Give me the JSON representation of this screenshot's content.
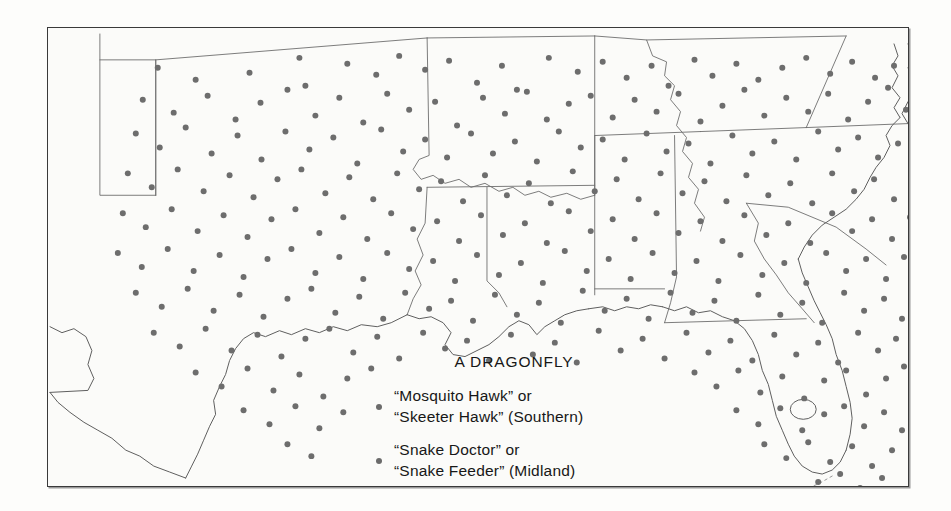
{
  "figure": {
    "type": "dot-distribution-map",
    "region": "Southern and Midland United States",
    "background_color": "#fbfbf9",
    "frame_color": "#3a3a3a",
    "dot_color": "#6d6d6d",
    "boundary_color": "#6e6e6e",
    "coast_color": "#5e5e5e"
  },
  "legend": {
    "title": "A DRAGONFLY",
    "entries": [
      {
        "marker": "filled-dot",
        "line1": "“Mosquito Hawk” or",
        "line2": "“Skeeter Hawk” (Southern)",
        "dialect": "Southern"
      },
      {
        "marker": "filled-dot",
        "line1": "“Snake Doctor” or",
        "line2": "“Snake Feeder” (Midland)",
        "dialect": "Midland"
      }
    ]
  },
  "map_data": {
    "dot_radius": 3.0,
    "dots": [
      [
        110,
        40
      ],
      [
        148,
        52
      ],
      [
        202,
        45
      ],
      [
        252,
        30
      ],
      [
        258,
        58
      ],
      [
        300,
        36
      ],
      [
        329,
        47
      ],
      [
        352,
        28
      ],
      [
        378,
        42
      ],
      [
        402,
        33
      ],
      [
        430,
        55
      ],
      [
        455,
        38
      ],
      [
        470,
        62
      ],
      [
        502,
        30
      ],
      [
        531,
        44
      ],
      [
        556,
        34
      ],
      [
        580,
        50
      ],
      [
        605,
        38
      ],
      [
        622,
        58
      ],
      [
        648,
        32
      ],
      [
        666,
        48
      ],
      [
        690,
        36
      ],
      [
        712,
        52
      ],
      [
        736,
        40
      ],
      [
        760,
        30
      ],
      [
        784,
        46
      ],
      [
        806,
        34
      ],
      [
        829,
        50
      ],
      [
        848,
        38
      ],
      [
        866,
        56
      ],
      [
        95,
        72
      ],
      [
        126,
        85
      ],
      [
        160,
        68
      ],
      [
        188,
        92
      ],
      [
        213,
        75
      ],
      [
        240,
        62
      ],
      [
        268,
        88
      ],
      [
        292,
        70
      ],
      [
        316,
        95
      ],
      [
        340,
        66
      ],
      [
        362,
        82
      ],
      [
        388,
        74
      ],
      [
        410,
        98
      ],
      [
        436,
        70
      ],
      [
        458,
        86
      ],
      [
        480,
        64
      ],
      [
        500,
        92
      ],
      [
        522,
        76
      ],
      [
        544,
        68
      ],
      [
        566,
        90
      ],
      [
        588,
        72
      ],
      [
        610,
        84
      ],
      [
        632,
        66
      ],
      [
        654,
        94
      ],
      [
        676,
        78
      ],
      [
        698,
        62
      ],
      [
        718,
        88
      ],
      [
        740,
        70
      ],
      [
        762,
        84
      ],
      [
        782,
        66
      ],
      [
        802,
        92
      ],
      [
        822,
        74
      ],
      [
        842,
        60
      ],
      [
        860,
        82
      ],
      [
        876,
        70
      ],
      [
        88,
        106
      ],
      [
        112,
        120
      ],
      [
        138,
        100
      ],
      [
        164,
        126
      ],
      [
        190,
        108
      ],
      [
        214,
        132
      ],
      [
        238,
        104
      ],
      [
        262,
        122
      ],
      [
        286,
        110
      ],
      [
        310,
        136
      ],
      [
        334,
        102
      ],
      [
        356,
        124
      ],
      [
        378,
        112
      ],
      [
        400,
        130
      ],
      [
        424,
        106
      ],
      [
        446,
        126
      ],
      [
        468,
        114
      ],
      [
        490,
        134
      ],
      [
        512,
        104
      ],
      [
        534,
        120
      ],
      [
        556,
        112
      ],
      [
        578,
        132
      ],
      [
        600,
        106
      ],
      [
        620,
        124
      ],
      [
        642,
        116
      ],
      [
        664,
        136
      ],
      [
        686,
        108
      ],
      [
        706,
        126
      ],
      [
        728,
        114
      ],
      [
        750,
        132
      ],
      [
        772,
        104
      ],
      [
        792,
        122
      ],
      [
        812,
        110
      ],
      [
        832,
        130
      ],
      [
        852,
        116
      ],
      [
        870,
        100
      ],
      [
        80,
        146
      ],
      [
        104,
        160
      ],
      [
        130,
        142
      ],
      [
        156,
        164
      ],
      [
        182,
        148
      ],
      [
        206,
        170
      ],
      [
        230,
        152
      ],
      [
        254,
        142
      ],
      [
        278,
        166
      ],
      [
        302,
        150
      ],
      [
        326,
        172
      ],
      [
        350,
        146
      ],
      [
        372,
        162
      ],
      [
        394,
        154
      ],
      [
        416,
        174
      ],
      [
        438,
        148
      ],
      [
        460,
        168
      ],
      [
        482,
        156
      ],
      [
        504,
        176
      ],
      [
        526,
        144
      ],
      [
        548,
        164
      ],
      [
        570,
        152
      ],
      [
        592,
        172
      ],
      [
        614,
        146
      ],
      [
        636,
        166
      ],
      [
        658,
        154
      ],
      [
        680,
        174
      ],
      [
        700,
        148
      ],
      [
        722,
        168
      ],
      [
        744,
        156
      ],
      [
        766,
        176
      ],
      [
        786,
        146
      ],
      [
        808,
        164
      ],
      [
        828,
        152
      ],
      [
        848,
        172
      ],
      [
        868,
        150
      ],
      [
        75,
        186
      ],
      [
        98,
        200
      ],
      [
        124,
        182
      ],
      [
        150,
        204
      ],
      [
        176,
        188
      ],
      [
        200,
        210
      ],
      [
        224,
        192
      ],
      [
        248,
        182
      ],
      [
        272,
        206
      ],
      [
        296,
        190
      ],
      [
        320,
        212
      ],
      [
        344,
        186
      ],
      [
        366,
        202
      ],
      [
        390,
        194
      ],
      [
        412,
        214
      ],
      [
        434,
        188
      ],
      [
        456,
        208
      ],
      [
        478,
        196
      ],
      [
        500,
        216
      ],
      [
        522,
        184
      ],
      [
        544,
        204
      ],
      [
        566,
        192
      ],
      [
        588,
        212
      ],
      [
        610,
        186
      ],
      [
        632,
        206
      ],
      [
        654,
        194
      ],
      [
        676,
        214
      ],
      [
        698,
        188
      ],
      [
        720,
        208
      ],
      [
        742,
        196
      ],
      [
        764,
        216
      ],
      [
        786,
        186
      ],
      [
        806,
        204
      ],
      [
        826,
        192
      ],
      [
        846,
        212
      ],
      [
        864,
        190
      ],
      [
        70,
        226
      ],
      [
        94,
        240
      ],
      [
        120,
        222
      ],
      [
        146,
        244
      ],
      [
        172,
        228
      ],
      [
        196,
        250
      ],
      [
        220,
        232
      ],
      [
        244,
        222
      ],
      [
        268,
        246
      ],
      [
        292,
        230
      ],
      [
        316,
        252
      ],
      [
        340,
        226
      ],
      [
        362,
        242
      ],
      [
        386,
        234
      ],
      [
        408,
        254
      ],
      [
        430,
        228
      ],
      [
        452,
        248
      ],
      [
        474,
        236
      ],
      [
        496,
        256
      ],
      [
        518,
        224
      ],
      [
        540,
        244
      ],
      [
        562,
        232
      ],
      [
        584,
        252
      ],
      [
        606,
        226
      ],
      [
        628,
        246
      ],
      [
        650,
        234
      ],
      [
        672,
        254
      ],
      [
        694,
        228
      ],
      [
        716,
        248
      ],
      [
        738,
        236
      ],
      [
        760,
        256
      ],
      [
        780,
        226
      ],
      [
        800,
        244
      ],
      [
        820,
        232
      ],
      [
        840,
        252
      ],
      [
        858,
        230
      ],
      [
        88,
        266
      ],
      [
        114,
        280
      ],
      [
        140,
        262
      ],
      [
        166,
        284
      ],
      [
        192,
        268
      ],
      [
        216,
        290
      ],
      [
        240,
        272
      ],
      [
        264,
        262
      ],
      [
        288,
        286
      ],
      [
        312,
        270
      ],
      [
        336,
        292
      ],
      [
        358,
        266
      ],
      [
        382,
        282
      ],
      [
        404,
        274
      ],
      [
        426,
        294
      ],
      [
        448,
        268
      ],
      [
        470,
        288
      ],
      [
        492,
        276
      ],
      [
        514,
        296
      ],
      [
        536,
        264
      ],
      [
        558,
        284
      ],
      [
        580,
        272
      ],
      [
        602,
        292
      ],
      [
        624,
        266
      ],
      [
        646,
        286
      ],
      [
        668,
        274
      ],
      [
        690,
        294
      ],
      [
        712,
        268
      ],
      [
        734,
        288
      ],
      [
        756,
        276
      ],
      [
        776,
        296
      ],
      [
        798,
        266
      ],
      [
        818,
        284
      ],
      [
        838,
        272
      ],
      [
        856,
        292
      ],
      [
        106,
        306
      ],
      [
        132,
        320
      ],
      [
        158,
        302
      ],
      [
        184,
        324
      ],
      [
        210,
        308
      ],
      [
        234,
        330
      ],
      [
        258,
        312
      ],
      [
        282,
        302
      ],
      [
        306,
        326
      ],
      [
        330,
        310
      ],
      [
        352,
        332
      ],
      [
        376,
        306
      ],
      [
        398,
        322
      ],
      [
        420,
        314
      ],
      [
        442,
        334
      ],
      [
        464,
        308
      ],
      [
        486,
        328
      ],
      [
        508,
        316
      ],
      [
        530,
        336
      ],
      [
        552,
        304
      ],
      [
        574,
        324
      ],
      [
        596,
        312
      ],
      [
        618,
        332
      ],
      [
        640,
        306
      ],
      [
        662,
        326
      ],
      [
        684,
        314
      ],
      [
        706,
        334
      ],
      [
        728,
        308
      ],
      [
        750,
        328
      ],
      [
        772,
        316
      ],
      [
        792,
        336
      ],
      [
        812,
        306
      ],
      [
        832,
        324
      ],
      [
        850,
        312
      ],
      [
        148,
        346
      ],
      [
        174,
        360
      ],
      [
        200,
        342
      ],
      [
        226,
        364
      ],
      [
        252,
        348
      ],
      [
        276,
        370
      ],
      [
        300,
        352
      ],
      [
        324,
        342
      ],
      [
        648,
        346
      ],
      [
        670,
        360
      ],
      [
        692,
        344
      ],
      [
        714,
        366
      ],
      [
        736,
        350
      ],
      [
        758,
        372
      ],
      [
        778,
        354
      ],
      [
        800,
        344
      ],
      [
        820,
        368
      ],
      [
        840,
        352
      ],
      [
        858,
        340
      ],
      [
        196,
        384
      ],
      [
        222,
        398
      ],
      [
        248,
        380
      ],
      [
        272,
        402
      ],
      [
        296,
        386
      ],
      [
        690,
        384
      ],
      [
        712,
        398
      ],
      [
        734,
        382
      ],
      [
        756,
        404
      ],
      [
        778,
        388
      ],
      [
        798,
        380
      ],
      [
        818,
        400
      ],
      [
        838,
        386
      ],
      [
        856,
        404
      ],
      [
        240,
        418
      ],
      [
        264,
        430
      ],
      [
        718,
        418
      ],
      [
        740,
        432
      ],
      [
        762,
        416
      ],
      [
        784,
        436
      ],
      [
        806,
        420
      ],
      [
        826,
        440
      ],
      [
        846,
        424
      ],
      [
        772,
        456
      ],
      [
        794,
        448
      ],
      [
        814,
        462
      ],
      [
        836,
        452
      ]
    ]
  }
}
